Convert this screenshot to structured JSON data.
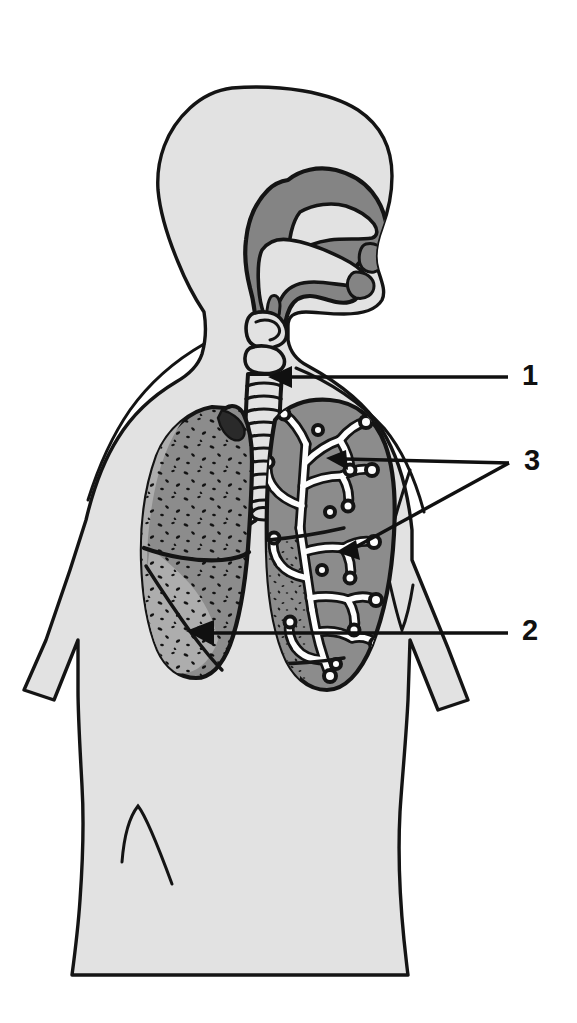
{
  "figure": {
    "background_color": "#ffffff"
  },
  "colors": {
    "body_fill": "#e2e2e2",
    "body_outline": "#141414",
    "airway_fill": "#848484",
    "lung_fill": "#8c8c8c",
    "lung_highlight": "#a5a5a5",
    "bronchi_fill": "#fdfdfd",
    "speckle": "#121212",
    "label_text": "#101010",
    "leader_line": "#101010"
  },
  "callouts": [
    {
      "id": "callout-1",
      "label": "1",
      "refers_to": "trachea",
      "label_x": 524,
      "label_y": 363,
      "leader": {
        "x1": 508,
        "y1": 377,
        "x2": 288,
        "y2": 377
      },
      "arrow_tip": {
        "x": 270,
        "y": 377
      },
      "has_arrowhead": true
    },
    {
      "id": "callout-3",
      "label": "3",
      "refers_to": "bronchi",
      "label_x": 526,
      "label_y": 448,
      "leader": {
        "x1": 508,
        "y1": 463,
        "x2": 340,
        "y2": 459
      },
      "arrow_tip": {
        "x": 330,
        "y": 458
      },
      "has_arrowhead": true,
      "second_leader": {
        "x1": 508,
        "y1": 463,
        "x2": 350,
        "y2": 548
      },
      "second_arrow_tip": {
        "x": 338,
        "y": 552
      }
    },
    {
      "id": "callout-2",
      "label": "2",
      "refers_to": "lung",
      "label_x": 524,
      "label_y": 618,
      "leader": {
        "x1": 508,
        "y1": 633,
        "x2": 212,
        "y2": 633
      },
      "arrow_tip": {
        "x": 186,
        "y": 631
      },
      "has_arrowhead": true
    }
  ],
  "structures": [
    {
      "name": "head-profile",
      "kind": "silhouette"
    },
    {
      "name": "nasal-cavity",
      "kind": "airway"
    },
    {
      "name": "oral-cavity-tongue",
      "kind": "airway"
    },
    {
      "name": "pharynx",
      "kind": "airway"
    },
    {
      "name": "larynx",
      "kind": "airway"
    },
    {
      "name": "trachea",
      "kind": "airway",
      "feature": "cartilage-rings"
    },
    {
      "name": "left-lung",
      "kind": "lung",
      "feature": "stippled-lobes"
    },
    {
      "name": "right-lung",
      "kind": "lung",
      "feature": "cutaway-bronchial-tree"
    },
    {
      "name": "torso",
      "kind": "silhouette"
    },
    {
      "name": "left-arm",
      "kind": "silhouette"
    },
    {
      "name": "right-arm",
      "kind": "silhouette"
    }
  ]
}
